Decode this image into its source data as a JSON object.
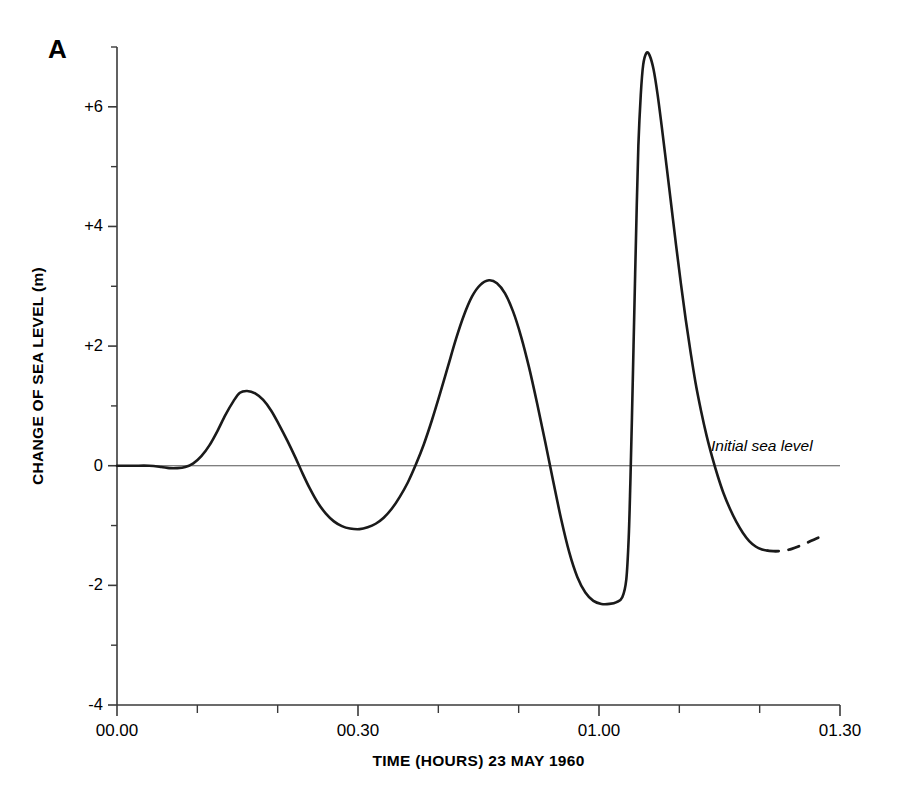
{
  "figure": {
    "panel_label": "A"
  },
  "chart_data": {
    "type": "line",
    "title": "",
    "xlabel": "TIME (HOURS) 23 MAY 1960",
    "ylabel": "CHANGE OF SEA LEVEL (m)",
    "xlim": [
      0,
      90
    ],
    "ylim": [
      -4,
      7
    ],
    "grid": false,
    "legend": "none",
    "x_unit": "minutes after 00.00",
    "y_unit": "m",
    "xticks_major": [
      0,
      30,
      60,
      90
    ],
    "xtick_labels": [
      "00.00",
      "00.30",
      "01.00",
      "01.30"
    ],
    "xticks_minor": [
      10,
      20,
      40,
      50,
      70,
      80
    ],
    "yticks_major": [
      6,
      4,
      2,
      0,
      -2,
      -4
    ],
    "ytick_labels": [
      "+6",
      "+4",
      "+2",
      "0",
      "-2",
      "-4"
    ],
    "yticks_minor": [
      7,
      5,
      3,
      1,
      -1,
      -3
    ],
    "reference_line": {
      "y": 0,
      "label": "Initial sea level"
    },
    "series": [
      {
        "name": "Sea level change (observed)",
        "style": "solid",
        "color": "#1a1a1a",
        "points": [
          [
            0.0,
            0.0
          ],
          [
            2.0,
            0.0
          ],
          [
            4.0,
            0.0
          ],
          [
            5.5,
            -0.02
          ],
          [
            6.5,
            -0.04
          ],
          [
            7.5,
            -0.04
          ],
          [
            8.5,
            -0.02
          ],
          [
            9.5,
            0.04
          ],
          [
            10.5,
            0.16
          ],
          [
            11.5,
            0.34
          ],
          [
            12.5,
            0.58
          ],
          [
            13.5,
            0.85
          ],
          [
            14.5,
            1.08
          ],
          [
            15.3,
            1.22
          ],
          [
            16.2,
            1.25
          ],
          [
            17.2,
            1.21
          ],
          [
            18.2,
            1.1
          ],
          [
            19.2,
            0.92
          ],
          [
            20.2,
            0.68
          ],
          [
            21.2,
            0.42
          ],
          [
            22.2,
            0.14
          ],
          [
            23.0,
            -0.1
          ],
          [
            24.0,
            -0.38
          ],
          [
            25.0,
            -0.62
          ],
          [
            26.0,
            -0.8
          ],
          [
            27.0,
            -0.93
          ],
          [
            28.0,
            -1.01
          ],
          [
            29.0,
            -1.05
          ],
          [
            30.2,
            -1.06
          ],
          [
            31.2,
            -1.03
          ],
          [
            32.2,
            -0.97
          ],
          [
            33.2,
            -0.87
          ],
          [
            34.2,
            -0.72
          ],
          [
            35.2,
            -0.52
          ],
          [
            36.2,
            -0.28
          ],
          [
            37.2,
            0.02
          ],
          [
            38.2,
            0.36
          ],
          [
            39.2,
            0.76
          ],
          [
            40.2,
            1.2
          ],
          [
            41.2,
            1.66
          ],
          [
            42.2,
            2.12
          ],
          [
            43.2,
            2.52
          ],
          [
            44.2,
            2.83
          ],
          [
            45.2,
            3.02
          ],
          [
            46.3,
            3.1
          ],
          [
            47.3,
            3.05
          ],
          [
            48.3,
            2.88
          ],
          [
            49.3,
            2.58
          ],
          [
            50.3,
            2.16
          ],
          [
            51.3,
            1.64
          ],
          [
            52.3,
            1.04
          ],
          [
            53.3,
            0.4
          ],
          [
            54.3,
            -0.26
          ],
          [
            55.3,
            -0.9
          ],
          [
            56.3,
            -1.45
          ],
          [
            57.3,
            -1.86
          ],
          [
            58.3,
            -2.12
          ],
          [
            59.3,
            -2.26
          ],
          [
            60.3,
            -2.31
          ],
          [
            61.3,
            -2.31
          ],
          [
            62.2,
            -2.28
          ],
          [
            62.9,
            -2.2
          ],
          [
            63.4,
            -1.9
          ],
          [
            63.7,
            -1.2
          ],
          [
            63.9,
            -0.3
          ],
          [
            64.1,
            0.8
          ],
          [
            64.3,
            2.0
          ],
          [
            64.5,
            3.2
          ],
          [
            64.7,
            4.35
          ],
          [
            64.9,
            5.35
          ],
          [
            65.2,
            6.2
          ],
          [
            65.5,
            6.7
          ],
          [
            65.9,
            6.9
          ],
          [
            66.3,
            6.86
          ],
          [
            66.8,
            6.62
          ],
          [
            67.3,
            6.2
          ],
          [
            67.8,
            5.68
          ],
          [
            68.4,
            5.02
          ],
          [
            69.0,
            4.35
          ],
          [
            69.6,
            3.68
          ],
          [
            70.2,
            3.04
          ],
          [
            70.8,
            2.44
          ],
          [
            71.4,
            1.9
          ],
          [
            72.0,
            1.4
          ],
          [
            72.7,
            0.92
          ],
          [
            73.4,
            0.5
          ],
          [
            74.1,
            0.14
          ],
          [
            74.8,
            -0.18
          ],
          [
            75.5,
            -0.46
          ],
          [
            76.3,
            -0.72
          ],
          [
            77.1,
            -0.94
          ],
          [
            77.9,
            -1.12
          ],
          [
            78.7,
            -1.26
          ],
          [
            79.5,
            -1.35
          ],
          [
            80.3,
            -1.4
          ],
          [
            81.0,
            -1.42
          ]
        ]
      },
      {
        "name": "Sea level change (inferred / uncertain)",
        "style": "dashed",
        "color": "#1a1a1a",
        "points": [
          [
            81.0,
            -1.42
          ],
          [
            82.0,
            -1.43
          ],
          [
            83.0,
            -1.42
          ],
          [
            84.0,
            -1.39
          ],
          [
            85.0,
            -1.34
          ],
          [
            86.0,
            -1.28
          ],
          [
            87.0,
            -1.22
          ],
          [
            87.8,
            -1.18
          ]
        ]
      }
    ],
    "notable_values": {
      "first_crest_m": 1.25,
      "first_trough_m": -1.06,
      "second_crest_m": 3.1,
      "second_trough_m": -2.31,
      "main_crest_m": 6.9,
      "tail_level_m": -1.4
    }
  }
}
